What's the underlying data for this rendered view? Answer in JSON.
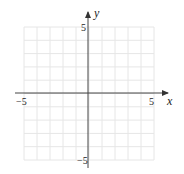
{
  "chart_data": {
    "type": "line",
    "title": "",
    "xlabel": "x",
    "ylabel": "y",
    "xlim": [
      -5,
      5
    ],
    "ylim": [
      -5,
      5
    ],
    "grid": true,
    "grid_step": 1,
    "x_tick_labels": [
      "-5",
      "5"
    ],
    "y_tick_labels": [
      "5",
      "-5"
    ],
    "series": [],
    "colors": {
      "axis": "#444444",
      "grid": "#e6e6e6",
      "text": "#222222"
    }
  },
  "labels": {
    "x_axis": "x",
    "y_axis": "y",
    "x_min": "−5",
    "x_max": "5",
    "y_max": "5",
    "y_min": "−5"
  }
}
